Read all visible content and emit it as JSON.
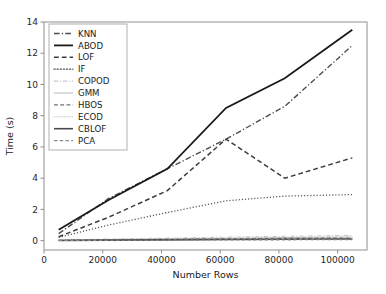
{
  "chart_data": {
    "type": "line",
    "title": "",
    "xlabel": "Number Rows",
    "ylabel": "Time (s)",
    "xlim": [
      0,
      110000
    ],
    "ylim": [
      -0.6,
      14
    ],
    "xticks": [
      0,
      20000,
      40000,
      60000,
      80000,
      100000
    ],
    "xtick_labels": [
      "0",
      "20000",
      "40000",
      "60000",
      "80000",
      "100000"
    ],
    "yticks": [
      0,
      2,
      4,
      6,
      8,
      10,
      12,
      14
    ],
    "ytick_labels": [
      "0",
      "2",
      "4",
      "6",
      "8",
      "10",
      "12",
      "14"
    ],
    "grid": false,
    "legend_position": "upper left",
    "x": [
      5000,
      22000,
      42000,
      62000,
      82000,
      105000
    ],
    "series": [
      {
        "name": "KNN",
        "style": "dash-dot",
        "color": "#4d4d4d",
        "width": 1.4,
        "values": [
          0.45,
          2.7,
          4.6,
          6.5,
          8.6,
          12.5
        ]
      },
      {
        "name": "ABOD",
        "style": "solid",
        "color": "#1a1a1a",
        "width": 1.8,
        "values": [
          0.7,
          2.6,
          4.6,
          8.5,
          10.4,
          13.5
        ]
      },
      {
        "name": "LOF",
        "style": "dashed",
        "color": "#3d3d3d",
        "width": 1.5,
        "values": [
          0.25,
          1.5,
          3.2,
          6.5,
          4.0,
          5.3
        ]
      },
      {
        "name": "IF",
        "style": "dotted",
        "color": "#555555",
        "width": 1.3,
        "values": [
          0.2,
          1.0,
          1.8,
          2.55,
          2.85,
          2.95
        ]
      },
      {
        "name": "COPOD",
        "style": "dash-dot",
        "color": "#c8c8c8",
        "width": 1.1,
        "values": [
          0.04,
          0.1,
          0.16,
          0.22,
          0.28,
          0.34
        ]
      },
      {
        "name": "GMM",
        "style": "solid",
        "color": "#bdbdbd",
        "width": 1.1,
        "values": [
          0.03,
          0.07,
          0.11,
          0.15,
          0.19,
          0.23
        ]
      },
      {
        "name": "HBOS",
        "style": "dashed",
        "color": "#707070",
        "width": 1.2,
        "values": [
          0.02,
          0.05,
          0.08,
          0.11,
          0.14,
          0.17
        ]
      },
      {
        "name": "ECOD",
        "style": "dotted",
        "color": "#cccccc",
        "width": 1.1,
        "values": [
          0.02,
          0.04,
          0.06,
          0.09,
          0.11,
          0.13
        ]
      },
      {
        "name": "CBLOF",
        "style": "solid",
        "color": "#4a4a4a",
        "width": 1.6,
        "values": [
          0.01,
          0.03,
          0.05,
          0.07,
          0.09,
          0.1
        ]
      },
      {
        "name": "PCA",
        "style": "dashed",
        "color": "#8a8a8a",
        "width": 1.1,
        "values": [
          0.01,
          0.02,
          0.03,
          0.04,
          0.05,
          0.06
        ]
      }
    ]
  },
  "legend": {
    "entries": [
      {
        "label": "KNN"
      },
      {
        "label": "ABOD"
      },
      {
        "label": "LOF"
      },
      {
        "label": "IF"
      },
      {
        "label": "COPOD"
      },
      {
        "label": "GMM"
      },
      {
        "label": "HBOS"
      },
      {
        "label": "ECOD"
      },
      {
        "label": "CBLOF"
      },
      {
        "label": "PCA"
      }
    ]
  }
}
